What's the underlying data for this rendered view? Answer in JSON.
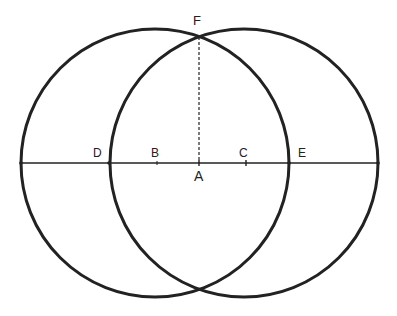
{
  "diagram": {
    "colors": {
      "stroke": "#222222",
      "background": "#ffffff"
    },
    "circles": [
      {
        "name": "left-circle",
        "cx": 155,
        "cy": 163,
        "r": 134
      },
      {
        "name": "right-circle",
        "cx": 244,
        "cy": 163,
        "r": 134
      }
    ],
    "line": {
      "x1": 21,
      "y1": 163,
      "x2": 378,
      "y2": 163
    },
    "dashed": {
      "x1": 199,
      "y1": 37,
      "x2": 199,
      "y2": 163
    },
    "labels": {
      "F": "F",
      "D": "D",
      "B": "B",
      "A": "A",
      "C": "C",
      "E": "E"
    }
  }
}
